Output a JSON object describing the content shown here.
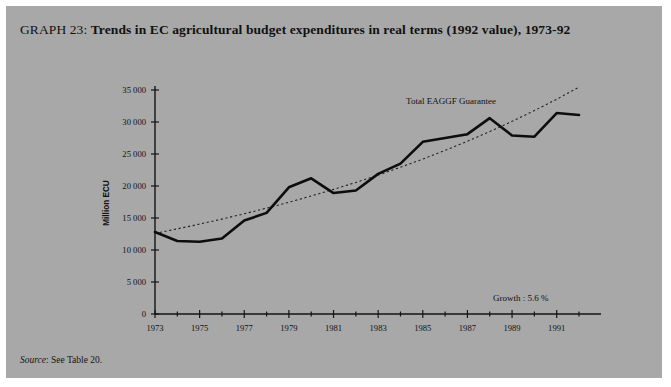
{
  "page": {
    "background_color": "#a8a8a8",
    "outer_background_color": "#ffffff"
  },
  "title": {
    "prefix": "GRAPH 23",
    "separator": ": ",
    "text": "Trends in EC agricultural budget expenditures in real terms (1992 value), 1973-92",
    "full": "GRAPH 23: Trends in EC agricultural budget expenditures in real terms (1992 value), 1973-92"
  },
  "source_note": {
    "label": "Source",
    "separator": ": ",
    "text": "See Table 20.",
    "full": "Source: See Table 20."
  },
  "annotations": {
    "series_label": "Total EAGGF Guarantee",
    "growth_label": "Growth : 5.6 %"
  },
  "chart_data": {
    "type": "line",
    "title": "Trends in EC agricultural budget expenditures in real terms (1992 value), 1973-92",
    "xlabel": "",
    "ylabel": "Million ECU",
    "x": [
      1973,
      1974,
      1975,
      1976,
      1977,
      1978,
      1979,
      1980,
      1981,
      1982,
      1983,
      1984,
      1985,
      1986,
      1987,
      1988,
      1989,
      1990,
      1991,
      1992
    ],
    "xlim": [
      1973,
      1992
    ],
    "ylim": [
      0,
      35000
    ],
    "ytick_values": [
      0,
      5000,
      10000,
      15000,
      20000,
      25000,
      30000,
      35000
    ],
    "ytick_labels": [
      "0",
      "5 000",
      "10 000",
      "15 000",
      "20 000",
      "25 000",
      "30 000",
      "35 000"
    ],
    "xtick_values": [
      1973,
      1975,
      1977,
      1979,
      1981,
      1983,
      1985,
      1987,
      1989,
      1991
    ],
    "xtick_labels": [
      "1973",
      "1975",
      "1977",
      "1979",
      "1981",
      "1983",
      "1985",
      "1987",
      "1989",
      "1991"
    ],
    "xminor_values": [
      1974,
      1976,
      1978,
      1980,
      1982,
      1984,
      1986,
      1988,
      1990,
      1992
    ],
    "grid": false,
    "legend_position": "inline-annotation",
    "series": [
      {
        "name": "Total EAGGF Guarantee",
        "style": "solid",
        "color": "#0d0d0d",
        "values": [
          12800,
          11400,
          11300,
          11800,
          14600,
          15800,
          19800,
          21200,
          18900,
          19300,
          21900,
          23500,
          26900,
          27500,
          28100,
          30600,
          27900,
          27700,
          31400,
          31100
        ]
      },
      {
        "name": "Trend (growth 5.6 %)",
        "style": "dotted",
        "color": "#222222",
        "values": [
          12600,
          13300,
          14050,
          14830,
          15660,
          16540,
          17460,
          18440,
          19470,
          20560,
          21710,
          22930,
          24210,
          25560,
          26990,
          28500,
          30100,
          31780,
          33560,
          35440
        ]
      }
    ]
  }
}
